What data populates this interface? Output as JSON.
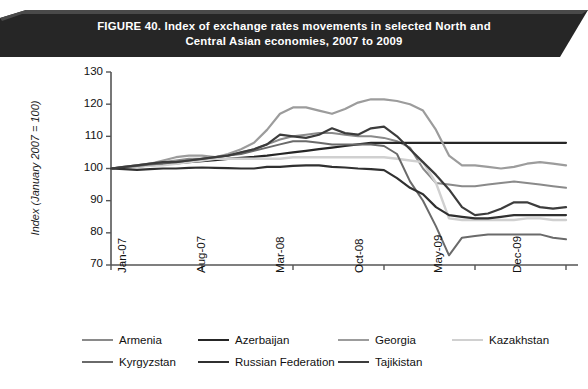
{
  "figure": {
    "banner": {
      "line1": "FIGURE 40. Index of exchange rates movements in selected North and",
      "line2": "Central Asian economies, 2007 to 2009",
      "background_color": "#262626",
      "text_color": "#ffffff"
    }
  },
  "chart_data": {
    "type": "line",
    "title": "FIGURE 40. Index of exchange rates movements in selected North and Central Asian economies, 2007 to 2009",
    "xlabel": "",
    "ylabel": "Index (January 2007 = 100)",
    "ylim": [
      70,
      130
    ],
    "yticks": [
      70,
      80,
      90,
      100,
      110,
      120,
      130
    ],
    "xticks": [
      "Jan-07",
      "Aug-07",
      "Mar-08",
      "Oct-08",
      "May-09",
      "Dec-09"
    ],
    "grid": false,
    "legend_position": "bottom",
    "x": [
      "Jan-07",
      "Feb-07",
      "Mar-07",
      "Apr-07",
      "May-07",
      "Jun-07",
      "Jul-07",
      "Aug-07",
      "Sep-07",
      "Oct-07",
      "Nov-07",
      "Dec-07",
      "Jan-08",
      "Feb-08",
      "Mar-08",
      "Apr-08",
      "May-08",
      "Jun-08",
      "Jul-08",
      "Aug-08",
      "Sep-08",
      "Oct-08",
      "Nov-08",
      "Dec-08",
      "Jan-09",
      "Feb-09",
      "Mar-09",
      "Apr-09",
      "May-09",
      "Jun-09",
      "Jul-09",
      "Aug-09",
      "Sep-09",
      "Oct-09",
      "Nov-09",
      "Dec-09"
    ],
    "series": [
      {
        "name": "Armenia",
        "color": "#8a8a8a",
        "width": 2.0,
        "values": [
          100,
          100.5,
          101,
          101.5,
          102,
          102.5,
          103,
          103,
          103.5,
          104,
          105,
          106,
          107.5,
          109,
          110,
          110.5,
          111,
          111,
          110.5,
          110,
          110,
          109.5,
          108.5,
          106.5,
          100,
          95.5,
          95,
          94.5,
          94.5,
          95,
          95.5,
          96,
          95.5,
          95,
          94.5,
          94
        ]
      },
      {
        "name": "Azerbaijan",
        "color": "#262626",
        "width": 2.2,
        "values": [
          100,
          100.3,
          100.6,
          101,
          101.3,
          101.6,
          102,
          102.3,
          102.6,
          103,
          103.3,
          103.6,
          104,
          104.5,
          105,
          105.5,
          106,
          106.5,
          107,
          107.5,
          108,
          108,
          108,
          108,
          108,
          108,
          108,
          108,
          108,
          108,
          108,
          108,
          108,
          108,
          108,
          108
        ]
      },
      {
        "name": "Georgia",
        "color": "#9c9c9c",
        "width": 2.2,
        "values": [
          100,
          100.5,
          101,
          101.5,
          102.5,
          103.5,
          104,
          104,
          103.5,
          104.5,
          106,
          108,
          112,
          117,
          119,
          119,
          118,
          117,
          118.5,
          120.5,
          121.5,
          121.5,
          121,
          120,
          118,
          112,
          104,
          101,
          101,
          100.5,
          100,
          100.5,
          101.5,
          102,
          101.5,
          101
        ]
      },
      {
        "name": "Kazakhstan",
        "color": "#d0d0d0",
        "width": 2.4,
        "values": [
          100,
          100.2,
          100.5,
          100.8,
          101,
          101.5,
          102,
          102.5,
          103,
          103,
          103,
          103,
          103,
          103,
          103.5,
          103.5,
          103.5,
          103.5,
          103.5,
          103.5,
          103.5,
          103.5,
          103,
          102.5,
          102,
          95.5,
          84.5,
          84,
          84,
          84,
          84,
          84,
          84.5,
          84.5,
          84,
          84
        ]
      },
      {
        "name": "Kyrgyzstan",
        "color": "#6a6a6a",
        "width": 2.0,
        "values": [
          100,
          100.4,
          100.8,
          101.2,
          101.6,
          102,
          102.5,
          103,
          103.5,
          104,
          104.5,
          105.5,
          106.5,
          107.5,
          108.5,
          108.5,
          108,
          107.5,
          107.5,
          107.5,
          107.5,
          107,
          104.5,
          96,
          90,
          82,
          73,
          78.5,
          79,
          79.5,
          79.5,
          79.5,
          79.5,
          79.5,
          78.5,
          78
        ]
      },
      {
        "name": "Russian Federation",
        "color": "#303030",
        "width": 2.2,
        "values": [
          100,
          99.8,
          99.6,
          99.8,
          100,
          100,
          100.2,
          100.3,
          100.2,
          100.1,
          100,
          100,
          100.5,
          100.5,
          100.8,
          101,
          101,
          100.5,
          100.3,
          100,
          99.8,
          99.5,
          97,
          94,
          92,
          88,
          85.5,
          85,
          84.5,
          84.5,
          85,
          85.5,
          85.5,
          85.5,
          85.5,
          85.5
        ]
      },
      {
        "name": "Tajikistan",
        "color": "#3c3c3c",
        "width": 2.2,
        "values": [
          100,
          100.5,
          101,
          101.5,
          102,
          102,
          102.5,
          103,
          103.5,
          104,
          105,
          106,
          107.5,
          110.5,
          110,
          109.5,
          110.5,
          112.5,
          111,
          110.5,
          112.5,
          113,
          110,
          106,
          102,
          98,
          93.5,
          88,
          85.5,
          86,
          87.5,
          89.5,
          89.5,
          88,
          87.5,
          88
        ]
      }
    ]
  },
  "axes": {
    "y_tick_labels": [
      "130",
      "120",
      "110",
      "100",
      "90",
      "80",
      "70"
    ],
    "x_tick_labels": [
      "Jan-07",
      "Aug-07",
      "Mar-08",
      "Oct-08",
      "May-09",
      "Dec-09"
    ],
    "y_axis_title": "Index (January 2007 = 100)"
  },
  "legend": {
    "rows": [
      [
        {
          "label": "Armenia",
          "color": "#8a8a8a",
          "width": 2.0
        },
        {
          "label": "Azerbaijan",
          "color": "#262626",
          "width": 2.6
        },
        {
          "label": "Georgia",
          "color": "#9c9c9c",
          "width": 2.2
        },
        {
          "label": "Kazakhstan",
          "color": "#d0d0d0",
          "width": 2.6
        }
      ],
      [
        {
          "label": "Kyrgyzstan",
          "color": "#6a6a6a",
          "width": 2.0
        },
        {
          "label": "Russian Federation",
          "color": "#303030",
          "width": 2.6
        },
        {
          "label": "Tajikistan",
          "color": "#3c3c3c",
          "width": 2.6
        }
      ]
    ]
  }
}
